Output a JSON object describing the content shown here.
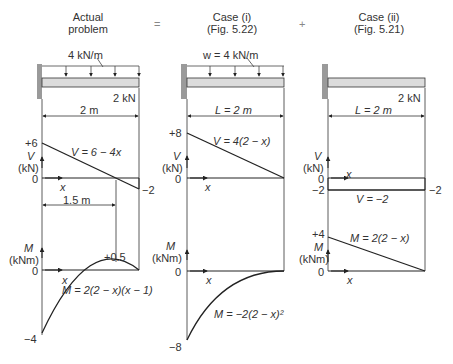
{
  "headers": {
    "actual": [
      "Actual",
      "problem"
    ],
    "equals": "=",
    "case1": [
      "Case (i)",
      "(Fig. 5.22)"
    ],
    "plus": "+",
    "case2": [
      "Case (ii)",
      "(Fig. 5.21)"
    ]
  },
  "panel1": {
    "load": "4 kN/m",
    "point_load": "2 kN",
    "span": "2 m",
    "v_top": "+6",
    "v_axis": [
      "V",
      "(kN)"
    ],
    "v_zero": "0",
    "v_x": "x",
    "v_eq": "V = 6 − 4x",
    "v_end": "−2",
    "dim_15": "1.5 m",
    "m_axis": [
      "M",
      "(kNm)"
    ],
    "m_zero": "0",
    "m_x": "x",
    "m_peak": "+0.5",
    "m_eq": "M = 2(2 − x)(x − 1)",
    "m_bottom": "−4"
  },
  "panel2": {
    "load": "w = 4 kN/m",
    "span": "L = 2 m",
    "v_top": "+8",
    "v_axis": [
      "V",
      "(kN)"
    ],
    "v_zero": "0",
    "v_x": "x",
    "v_eq": "V = 4(2 − x)",
    "m_axis": [
      "M",
      "(kNm)"
    ],
    "m_zero": "0",
    "m_x": "x",
    "m_eq": "M = −2(2 − x)²",
    "m_bottom": "−8"
  },
  "panel3": {
    "point_load": "2 kN",
    "span": "L = 2 m",
    "v_axis": [
      "V",
      "(kN)"
    ],
    "v_zero": "0",
    "v_x": "x",
    "v_left": "−2",
    "v_eq": "V = −2",
    "v_end": "−2",
    "m_top": "+4",
    "m_axis": [
      "M",
      "(kNm)"
    ],
    "m_zero": "0",
    "m_x": "x",
    "m_eq": "M = 2(2 − x)"
  },
  "colors": {
    "line": "#222222",
    "wall": "#9a9a9a",
    "beam_fill": "#dcdcdc"
  }
}
